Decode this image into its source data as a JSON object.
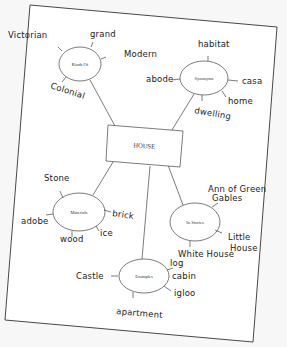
{
  "diagram": {
    "type": "concept-map",
    "paper": {
      "corners": [
        [
          30,
          5
        ],
        [
          277,
          27
        ],
        [
          253,
          342
        ],
        [
          5,
          320
        ]
      ],
      "fill": "#ffffff",
      "stroke": "#333333",
      "background": "#f7f7f7"
    },
    "center": {
      "label": "HOUSE",
      "rect": [
        [
          108,
          125
        ],
        [
          183,
          131
        ],
        [
          180,
          167
        ],
        [
          106,
          161
        ]
      ]
    },
    "nodes": [
      {
        "id": "kind-of",
        "label": "Kinds Of",
        "cx": 80,
        "cy": 64,
        "rx": 21,
        "ry": 17,
        "connect_from": [
          115,
          126
        ],
        "connect_to": [
          90,
          80
        ],
        "branches": [
          {
            "label": "Victorian",
            "tx": 8,
            "ty": 38,
            "line": [
              [
                62,
                51
              ],
              [
                58,
                47
              ]
            ]
          },
          {
            "label": "grand",
            "tx": 90,
            "ty": 37,
            "line": [
              [
                91,
                47
              ],
              [
                93,
                42
              ]
            ]
          },
          {
            "label": "Modern",
            "tx": 124,
            "ty": 57,
            "line": [
              [
                101,
                59
              ],
              [
                106,
                57
              ]
            ]
          },
          {
            "label": "Colonial",
            "tx": 50,
            "ty": 88,
            "rotate": 18,
            "line": [
              [
                66,
                77
              ],
              [
                62,
                82
              ]
            ]
          }
        ]
      },
      {
        "id": "synonyms",
        "label": "Synonyms",
        "cx": 204,
        "cy": 78,
        "rx": 24,
        "ry": 17,
        "connect_from": [
          172,
          130
        ],
        "connect_to": [
          194,
          94
        ],
        "branches": [
          {
            "label": "habitat",
            "tx": 198,
            "ty": 47,
            "line": [
              [
                208,
                61
              ],
              [
                208,
                56
              ]
            ]
          },
          {
            "label": "abode",
            "tx": 146,
            "ty": 82,
            "line": [
              [
                180,
                79
              ],
              [
                172,
                80
              ]
            ]
          },
          {
            "label": "casa",
            "tx": 242,
            "ty": 84,
            "line": [
              [
                228,
                80
              ],
              [
                238,
                81
              ]
            ]
          },
          {
            "label": "home",
            "tx": 228,
            "ty": 104,
            "line": [
              [
                222,
                91
              ],
              [
                226,
                97
              ]
            ]
          },
          {
            "label": "dwelling",
            "tx": 194,
            "ty": 113,
            "rotate": 10,
            "line": [
              [
                202,
                95
              ],
              [
                202,
                101
              ]
            ]
          }
        ]
      },
      {
        "id": "materials",
        "label": "Materials",
        "cx": 79,
        "cy": 212,
        "rx": 26,
        "ry": 19,
        "connect_from": [
          113,
          162
        ],
        "connect_to": [
          93,
          195
        ],
        "branches": [
          {
            "label": "Stone",
            "tx": 44,
            "ty": 181,
            "line": [
              [
                63,
                198
              ],
              [
                60,
                191
              ]
            ]
          },
          {
            "label": "adobe",
            "tx": 21,
            "ty": 224,
            "line": [
              [
                53,
                214
              ],
              [
                46,
                215
              ]
            ]
          },
          {
            "label": "brick",
            "tx": 112,
            "ty": 216,
            "rotate": 8,
            "line": [
              [
                104,
                210
              ],
              [
                111,
                212
              ]
            ]
          },
          {
            "label": "ice",
            "tx": 100,
            "ty": 236,
            "line": [
              [
                96,
                226
              ],
              [
                99,
                231
              ]
            ]
          },
          {
            "label": "wood",
            "tx": 60,
            "ty": 242,
            "line": [
              [
                72,
                231
              ],
              [
                72,
                237
              ]
            ]
          }
        ]
      },
      {
        "id": "in-stories",
        "label": "In Stories",
        "cx": 195,
        "cy": 222,
        "rx": 25,
        "ry": 19,
        "connect_from": [
          168,
          165
        ],
        "connect_to": [
          183,
          205
        ],
        "branches": [
          {
            "label": "Ann of Green",
            "tx": 208,
            "ty": 192,
            "line": [
              [
                212,
                207
              ],
              [
                218,
                203
              ]
            ]
          },
          {
            "label": "Gables",
            "tx": 212,
            "ty": 201,
            "line": null
          },
          {
            "label": "Little",
            "tx": 228,
            "ty": 240,
            "line": [
              [
                215,
                230
              ],
              [
                222,
                233
              ]
            ]
          },
          {
            "label": "House",
            "tx": 230,
            "ty": 251,
            "line": null
          },
          {
            "label": "White House",
            "tx": 178,
            "ty": 257,
            "line": [
              [
                190,
                241
              ],
              [
                190,
                247
              ]
            ]
          }
        ]
      },
      {
        "id": "examples",
        "label": "Examples",
        "cx": 144,
        "cy": 276,
        "rx": 25,
        "ry": 17,
        "connect_from": [
          150,
          166
        ],
        "connect_to": [
          142,
          259
        ],
        "branches": [
          {
            "label": "Castle",
            "tx": 76,
            "ty": 279,
            "line": [
              [
                118,
                276
              ],
              [
                111,
                276
              ]
            ]
          },
          {
            "label": "log",
            "tx": 170,
            "ty": 266,
            "line": [
              [
                167,
                270
              ],
              [
                173,
                268
              ]
            ]
          },
          {
            "label": "cabin",
            "tx": 172,
            "ty": 279,
            "line": null
          },
          {
            "label": "igloo",
            "tx": 174,
            "ty": 296,
            "line": [
              [
                164,
                286
              ],
              [
                171,
                291
              ]
            ]
          },
          {
            "label": "apartment",
            "tx": 116,
            "ty": 314,
            "rotate": 5,
            "line": [
              [
                133,
                292
              ],
              [
                133,
                298
              ]
            ]
          }
        ]
      }
    ]
  }
}
